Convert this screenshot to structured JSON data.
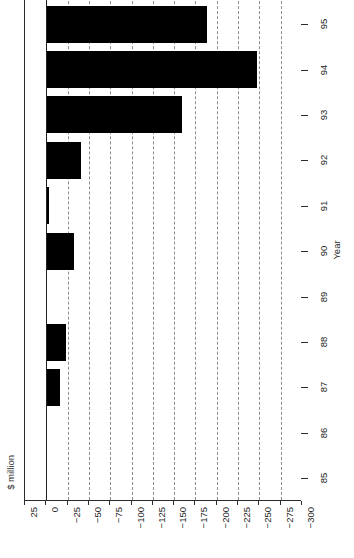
{
  "chart_data": {
    "type": "bar",
    "orientation": "horizontal",
    "title": "",
    "xlabel": "Year",
    "ylabel": "$ million",
    "categories": [
      "96",
      "95",
      "94",
      "93",
      "92",
      "91",
      "90",
      "89",
      "88",
      "87",
      "86",
      "85"
    ],
    "values": [
      -256,
      -189,
      -247,
      -159,
      -41,
      -3,
      -33,
      -1,
      -23,
      -16,
      0,
      0
    ],
    "value_ticks": [
      "25",
      "0",
      "-25",
      "-50",
      "-75",
      "-100",
      "-125",
      "-150",
      "-175",
      "-200",
      "-225",
      "-250",
      "-275",
      "-300"
    ],
    "value_tick_numbers": [
      25,
      0,
      -25,
      -50,
      -75,
      -100,
      -125,
      -150,
      -175,
      -200,
      -225,
      -250,
      -275,
      -300
    ],
    "category_ticks": [
      "96",
      "95",
      "94",
      "93",
      "92",
      "91",
      "90",
      "89",
      "88",
      "87",
      "86",
      "85"
    ],
    "xlim": [
      25,
      -300
    ],
    "grid": "vertical-dashed",
    "legend": "none",
    "bar_color": "#000000",
    "grid_color": "#8d8d8d",
    "axis_color": "#2b2b2b",
    "note_top_bar_clipped": true
  }
}
